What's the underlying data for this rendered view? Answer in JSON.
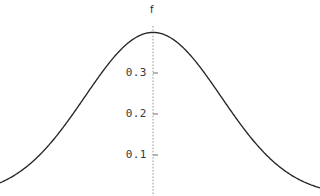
{
  "chart_data": {
    "type": "line",
    "title": "",
    "subtitle": "",
    "xlabel": "",
    "ylabel": "f",
    "ylabel_position": "top-of-axis",
    "grid": false,
    "legend": null,
    "background_color": "#ffffff",
    "curve_color": "#262626",
    "axis_color": "#9a9a9a",
    "axis_style": "dotted-vertical",
    "xlim": [
      -2.45,
      2.45
    ],
    "ylim": [
      0,
      0.44
    ],
    "y_ticks": [
      0.1,
      0.2,
      0.3
    ],
    "y_tick_labels": [
      "0.1",
      "0.2",
      "0.3"
    ],
    "x_ticks": [],
    "x_tick_labels": [],
    "annotations": [],
    "series": [
      {
        "name": "f",
        "peak_x": 0,
        "peak_y": 0.399,
        "sigma": 1,
        "x": [
          -2.45,
          -2.3,
          -2.15,
          -2.0,
          -1.85,
          -1.7,
          -1.55,
          -1.4,
          -1.25,
          -1.1,
          -0.95,
          -0.8,
          -0.65,
          -0.5,
          -0.35,
          -0.2,
          -0.05,
          0,
          0.05,
          0.2,
          0.35,
          0.5,
          0.65,
          0.8,
          0.95,
          1.1,
          1.25,
          1.4,
          1.55,
          1.7,
          1.85,
          2.0,
          2.15,
          2.3,
          2.45
        ],
        "values": [
          0.0198,
          0.0283,
          0.0396,
          0.054,
          0.0721,
          0.094,
          0.12,
          0.1497,
          0.1826,
          0.2179,
          0.2541,
          0.2897,
          0.323,
          0.3521,
          0.3752,
          0.391,
          0.3984,
          0.3989,
          0.3984,
          0.391,
          0.3752,
          0.3521,
          0.323,
          0.2897,
          0.2541,
          0.2179,
          0.1826,
          0.1497,
          0.12,
          0.094,
          0.0721,
          0.054,
          0.0396,
          0.0283,
          0.0198
        ]
      }
    ]
  },
  "labels": {
    "y_axis_title": "f",
    "tick_0_3": "0.3",
    "tick_0_2": "0.2",
    "tick_0_1": "0.1"
  }
}
